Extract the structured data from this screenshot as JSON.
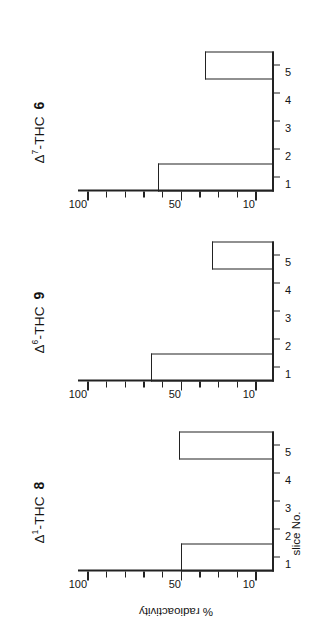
{
  "figure": {
    "background": "#ffffff",
    "ink": "#222222",
    "orientation": "rotated-90-ccw",
    "axis_title_y": "% radioactivity",
    "axis_title_x": "slice No."
  },
  "chart_data": [
    {
      "type": "bar",
      "title": "Δ¹-THC",
      "title_prefix": "Δ",
      "title_superscript": "1",
      "title_suffix": "-THC",
      "compound_number": "8",
      "categories": [
        "1",
        "2",
        "3",
        "4",
        "5"
      ],
      "values": [
        50,
        0,
        0,
        0,
        51
      ],
      "xlabel": "slice No.",
      "ylabel": "% radioactivity",
      "ylim": [
        0,
        105
      ],
      "ytick_values": [
        100,
        90,
        80,
        70,
        60,
        50,
        40,
        30,
        20,
        10
      ],
      "ytick_labels": [
        "100",
        "",
        "",
        "",
        "",
        "50",
        "",
        "",
        "",
        "10"
      ],
      "grid": false,
      "legend": "none"
    },
    {
      "type": "bar",
      "title": "Δ⁶-THC",
      "title_prefix": "Δ",
      "title_superscript": "6",
      "title_suffix": "-THC",
      "compound_number": "9",
      "categories": [
        "1",
        "2",
        "3",
        "4",
        "5"
      ],
      "values": [
        66,
        0,
        0,
        0,
        33
      ],
      "xlabel": "slice No.",
      "ylabel": "% radioactivity",
      "ylim": [
        0,
        105
      ],
      "ytick_values": [
        100,
        90,
        80,
        70,
        60,
        50,
        40,
        30,
        20,
        10
      ],
      "ytick_labels": [
        "100",
        "",
        "",
        "",
        "",
        "50",
        "",
        "",
        "",
        "10"
      ],
      "grid": false,
      "legend": "none"
    },
    {
      "type": "bar",
      "title": "Δ⁷-THC",
      "title_prefix": "Δ",
      "title_superscript": "7",
      "title_suffix": "-THC",
      "compound_number": "6",
      "categories": [
        "1",
        "2",
        "3",
        "4",
        "5"
      ],
      "values": [
        62,
        0,
        0,
        0,
        37
      ],
      "xlabel": "slice No.",
      "ylabel": "% radioactivity",
      "ylim": [
        0,
        105
      ],
      "ytick_values": [
        100,
        90,
        80,
        70,
        60,
        50,
        40,
        30,
        20,
        10
      ],
      "ytick_labels": [
        "100",
        "",
        "",
        "",
        "",
        "50",
        "",
        "",
        "",
        "10"
      ],
      "grid": false,
      "legend": "none"
    }
  ]
}
